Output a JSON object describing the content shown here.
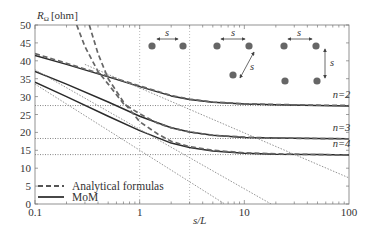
{
  "chart_data": {
    "type": "line",
    "title": "",
    "xlabel": "s/L",
    "ylabel": "R_Ω [ohm]",
    "ylabel_main": "R",
    "ylabel_sub": "Ω",
    "ylabel_unit": "[ohm]",
    "xscale": "log",
    "xlim": [
      0.1,
      100
    ],
    "ylim": [
      0,
      50
    ],
    "x_ticks": [
      0.1,
      1,
      10,
      100
    ],
    "x_tick_labels": [
      "0.1",
      "1",
      "10",
      "100"
    ],
    "y_ticks": [
      0,
      5,
      10,
      15,
      20,
      25,
      30,
      35,
      40,
      45,
      50
    ],
    "y_tick_labels": [
      "0",
      "5",
      "10",
      "15",
      "20",
      "25",
      "30",
      "35",
      "40",
      "45",
      "50"
    ],
    "grid": false,
    "legend": {
      "position": "lower left",
      "entries": [
        {
          "label": "Analytical formulas",
          "style": "dashed"
        },
        {
          "label": "MoM",
          "style": "solid"
        }
      ]
    },
    "reference_lines": {
      "horizontal": [
        27.5,
        18.3,
        13.8
      ],
      "vertical": [
        1,
        3
      ]
    },
    "series": [
      {
        "name": "MoM n=2",
        "style": "solid",
        "x": [
          0.1,
          0.2,
          0.5,
          1,
          2,
          3,
          5,
          10,
          20,
          50,
          100
        ],
        "y": [
          41.5,
          39.0,
          35.5,
          32.8,
          30.2,
          29.2,
          28.4,
          27.9,
          27.7,
          27.5,
          27.4
        ]
      },
      {
        "name": "MoM n=3",
        "style": "solid",
        "x": [
          0.1,
          0.2,
          0.5,
          1,
          2,
          3,
          5,
          10,
          20,
          50,
          100
        ],
        "y": [
          37.0,
          33.5,
          28.5,
          24.5,
          21.3,
          20.1,
          19.2,
          18.6,
          18.4,
          18.3,
          18.2
        ]
      },
      {
        "name": "MoM n=4",
        "style": "solid",
        "x": [
          0.1,
          0.2,
          0.5,
          1,
          2,
          3,
          5,
          10,
          20,
          50,
          100
        ],
        "y": [
          34.0,
          30.0,
          24.5,
          20.5,
          17.0,
          15.8,
          14.8,
          14.2,
          13.9,
          13.8,
          13.7
        ]
      },
      {
        "name": "Analytical n=2",
        "style": "dashed",
        "x": [
          0.1,
          0.2,
          0.5,
          1,
          2,
          3,
          5,
          10,
          20,
          50,
          100
        ],
        "y": [
          42.0,
          39.3,
          35.7,
          33.0,
          30.3,
          29.3,
          28.5,
          28.0,
          27.8,
          27.6,
          27.5
        ]
      },
      {
        "name": "Analytical n=3",
        "style": "dashed",
        "x": [
          0.25,
          0.3,
          0.4,
          0.5,
          0.7,
          1,
          1.5,
          2,
          3,
          5,
          10,
          20,
          50,
          100
        ],
        "y": [
          50.0,
          44.0,
          37.0,
          33.5,
          28.0,
          25.2,
          22.5,
          21.3,
          20.1,
          19.2,
          18.7,
          18.4,
          18.3,
          18.2
        ]
      },
      {
        "name": "Analytical n=4",
        "style": "dashed",
        "x": [
          0.33,
          0.4,
          0.5,
          0.7,
          1,
          1.5,
          2,
          3,
          5,
          10,
          20,
          50,
          100
        ],
        "y": [
          50.0,
          42.0,
          35.0,
          28.5,
          23.0,
          19.5,
          17.5,
          16.0,
          15.0,
          14.3,
          14.0,
          13.8,
          13.7
        ]
      },
      {
        "name": "Asymptote n=2",
        "style": "dotted",
        "x": [
          0.3,
          100
        ],
        "y": [
          39.0,
          7.3
        ]
      },
      {
        "name": "Asymptote n=3",
        "style": "dotted",
        "x": [
          0.1,
          18
        ],
        "y": [
          37.5,
          0
        ]
      },
      {
        "name": "Asymptote n=4",
        "style": "dotted",
        "x": [
          0.1,
          6.5
        ],
        "y": [
          33.5,
          0
        ]
      }
    ],
    "annotations": [
      {
        "text": "n=2",
        "x": 70,
        "y": 29.5
      },
      {
        "text": "n=3",
        "x": 70,
        "y": 20.3
      },
      {
        "text": "n=4",
        "x": 70,
        "y": 15.8
      },
      {
        "text": "s",
        "note": "inset geometry diagrams: 2, 3 and 4 electrode arrangements with spacing s"
      }
    ]
  },
  "inset": {
    "spacing_label": "s",
    "configs": [
      "two electrodes",
      "three electrodes (triangle)",
      "four electrodes (square)"
    ]
  }
}
